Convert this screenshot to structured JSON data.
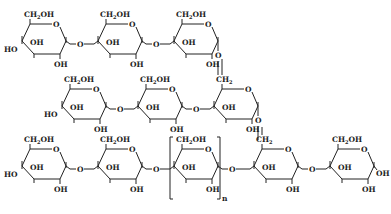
{
  "diagram": {
    "type": "chemical-structure",
    "labels": {
      "ring_oxygen": "O",
      "hydroxymethyl": "CH2OH",
      "methylene": "CH2",
      "hydroxyl": "OH",
      "hydroxyl_left": "HO",
      "link_oxygen": "O",
      "repeat_subscript": "n"
    },
    "rows": [
      {
        "name": "top-chain",
        "units": 3,
        "branch_from_last": "alpha-1,6 to middle chain"
      },
      {
        "name": "middle-chain",
        "units": 3,
        "last_unit_c6": "CH2",
        "branch_from_last": "alpha-1,6 to bottom chain"
      },
      {
        "name": "bottom-chain",
        "units": 5,
        "repeat_unit_index": 2,
        "repeat_subscript": "n",
        "branch_unit_index": 3
      }
    ],
    "colors": {
      "ink": "#222222",
      "background": "#ffffff"
    }
  }
}
